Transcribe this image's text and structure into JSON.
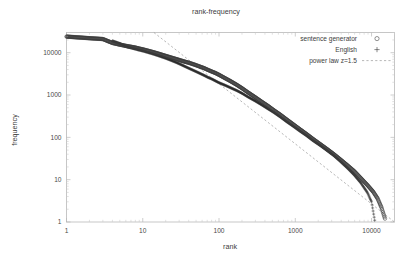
{
  "chart_data": {
    "type": "scatter",
    "title": "rank-frequency",
    "xlabel": "rank",
    "ylabel": "frequency",
    "xscale": "log",
    "yscale": "log",
    "xlim": [
      1,
      20000
    ],
    "ylim": [
      1,
      30000
    ],
    "grid": false,
    "legend_position": "top-right",
    "xticks": [
      "1",
      "10",
      "100",
      "1000",
      "10000"
    ],
    "xtick_values": [
      1,
      10,
      100,
      1000,
      10000
    ],
    "yticks": [
      "1",
      "10",
      "100",
      "1000",
      "10000"
    ],
    "ytick_values": [
      1,
      10,
      100,
      1000,
      10000
    ],
    "series": [
      {
        "name": "sentence generator",
        "marker": "circle",
        "color": "#3a3a3a",
        "x": [
          1,
          2,
          3,
          4,
          5,
          6,
          7,
          8,
          9,
          10,
          12,
          14,
          16,
          18,
          20,
          24,
          28,
          32,
          36,
          40,
          48,
          56,
          64,
          72,
          80,
          90,
          100,
          120,
          140,
          170,
          200,
          240,
          300,
          360,
          440,
          520,
          640,
          780,
          950,
          1150,
          1400,
          1700,
          2100,
          2600,
          3200,
          3900,
          4800,
          5900,
          7200,
          8800,
          10500,
          12000,
          13500,
          15000
        ],
        "y": [
          24000,
          22000,
          21000,
          17000,
          15500,
          14500,
          13800,
          13200,
          12500,
          12000,
          11000,
          10200,
          9500,
          8900,
          8400,
          7600,
          7000,
          6500,
          6100,
          5800,
          5200,
          4700,
          4300,
          3900,
          3600,
          3300,
          3000,
          2500,
          2150,
          1750,
          1450,
          1150,
          880,
          700,
          550,
          440,
          340,
          260,
          200,
          155,
          120,
          92,
          70,
          53,
          40,
          30,
          22,
          16,
          11,
          7.5,
          5.2,
          3.6,
          2.2,
          1.2
        ],
        "n_points": 54
      },
      {
        "name": "English",
        "marker": "plus",
        "color": "#2a2a2a",
        "x": [
          4,
          5,
          6,
          7,
          8,
          9,
          10,
          12,
          14,
          16,
          18,
          20,
          24,
          28,
          32,
          36,
          40,
          48,
          56,
          64,
          72,
          80,
          90,
          100,
          120,
          140,
          170,
          200,
          240,
          300,
          360,
          440,
          520,
          640,
          780,
          950,
          1150,
          1400,
          1700,
          2100,
          2600,
          3200,
          3900,
          4800,
          5900,
          7200,
          8800,
          10000,
          11000
        ],
        "y": [
          19000,
          16500,
          14000,
          13000,
          12200,
          11500,
          11000,
          10000,
          9200,
          8500,
          7900,
          7400,
          6500,
          5800,
          5200,
          4700,
          4300,
          3700,
          3250,
          2900,
          2600,
          2400,
          2150,
          1950,
          1700,
          1500,
          1280,
          1100,
          900,
          720,
          590,
          470,
          390,
          300,
          230,
          180,
          140,
          110,
          84,
          65,
          49,
          37,
          27,
          19,
          13,
          8.5,
          5.0,
          3.0,
          1.1
        ],
        "n_points": 49
      }
    ],
    "reference_line": {
      "name": "power law z=1.5",
      "style": "dashed",
      "color": "#9a9a9a",
      "exponent": 1.5,
      "x": [
        14,
        20000
      ],
      "y": [
        30000,
        1.0
      ]
    },
    "legend": [
      {
        "label": "sentence generator",
        "marker": "circle"
      },
      {
        "label": "English",
        "marker": "plus"
      },
      {
        "label": "power law z=1.5",
        "marker": "dashed-line"
      }
    ]
  }
}
